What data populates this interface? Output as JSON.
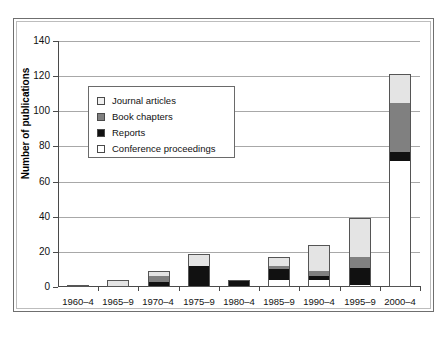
{
  "chart_data": {
    "type": "bar",
    "stacked": true,
    "title": "",
    "xlabel": "",
    "ylabel": "Number of publications",
    "ylim": [
      0,
      140
    ],
    "ytick_interval": 20,
    "yticks": [
      0,
      20,
      40,
      60,
      80,
      100,
      120,
      140
    ],
    "grid": true,
    "legend_position": "upper-left-inside",
    "categories": [
      "1960–4",
      "1965–9",
      "1970–4",
      "1975–9",
      "1980–4",
      "1985–9",
      "1990–4",
      "1995–9",
      "2000–4"
    ],
    "series": [
      {
        "name": "Conference proceedings",
        "color": "#ffffff",
        "values": [
          0,
          0,
          0,
          0,
          0,
          4,
          4,
          1,
          72
        ]
      },
      {
        "name": "Reports",
        "color": "#111111",
        "values": [
          1,
          0,
          3,
          12,
          4,
          6,
          2,
          10,
          5
        ]
      },
      {
        "name": "Book chapters",
        "color": "#808080",
        "values": [
          0,
          0,
          3,
          0,
          0,
          2,
          3,
          6,
          28
        ]
      },
      {
        "name": "Journal articles",
        "color": "#e4e4e4",
        "values": [
          0,
          4,
          3,
          7,
          0,
          5,
          15,
          22,
          16
        ]
      }
    ],
    "totals": [
      1,
      4,
      9,
      19,
      4,
      17,
      24,
      39,
      121
    ],
    "series_order_bottom_to_top": [
      "Conference proceedings",
      "Reports",
      "Book chapters",
      "Journal articles"
    ]
  },
  "legend": {
    "items": [
      {
        "label": "Journal articles",
        "swatch": "#f0f0f0"
      },
      {
        "label": "Book chapters",
        "swatch": "#808080"
      },
      {
        "label": "Reports",
        "swatch": "#111111"
      },
      {
        "label": "Conference proceedings",
        "swatch": "#ffffff"
      }
    ]
  },
  "axis": {
    "y_title": "Number of publications",
    "y_labels": [
      "140",
      "120",
      "100",
      "80",
      "60",
      "40",
      "20",
      "0"
    ],
    "x_labels": [
      "1960–4",
      "1965–9",
      "1970–4",
      "1975–9",
      "1980–4",
      "1985–9",
      "1990–4",
      "1995–9",
      "2000–4"
    ]
  }
}
